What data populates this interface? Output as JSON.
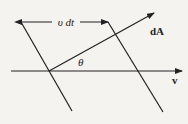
{
  "diagram": {
    "labels": {
      "displacement": "υ dt",
      "area_vector": "dA",
      "angle": "θ",
      "velocity": "v"
    },
    "colors": {
      "background": "#f4f3f0",
      "stroke": "#222222"
    }
  }
}
